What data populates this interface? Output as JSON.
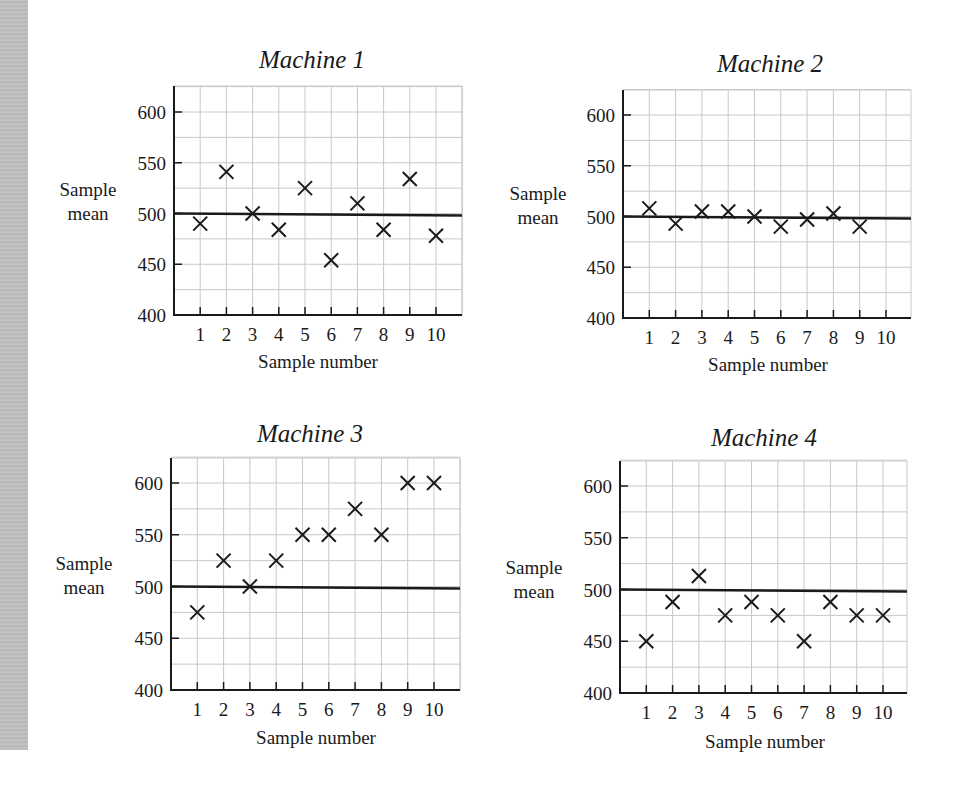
{
  "chart_data": [
    {
      "type": "scatter",
      "title": "Machine 1",
      "xlabel": "Sample number",
      "ylabel": "Sample mean",
      "x": [
        1,
        2,
        3,
        4,
        5,
        6,
        7,
        8,
        9,
        10
      ],
      "values": [
        490,
        541,
        500,
        484,
        525,
        454,
        510,
        484,
        534,
        478
      ],
      "reference_line": 500,
      "ylim": [
        400,
        620
      ],
      "yticks": [
        400,
        450,
        500,
        550,
        600
      ],
      "xticks": [
        1,
        2,
        3,
        4,
        5,
        6,
        7,
        8,
        9,
        10
      ],
      "grid": true,
      "marker": "x"
    },
    {
      "type": "scatter",
      "title": "Machine 2",
      "xlabel": "Sample number",
      "ylabel": "Sample mean",
      "x": [
        1,
        2,
        3,
        4,
        5,
        6,
        7,
        8,
        9
      ],
      "values": [
        508,
        493,
        505,
        505,
        500,
        490,
        497,
        503,
        490
      ],
      "reference_line": 500,
      "ylim": [
        400,
        620
      ],
      "yticks": [
        400,
        450,
        500,
        550,
        600
      ],
      "xticks": [
        1,
        2,
        3,
        4,
        5,
        6,
        7,
        8,
        9,
        10
      ],
      "grid": true,
      "marker": "x"
    },
    {
      "type": "scatter",
      "title": "Machine 3",
      "xlabel": "Sample number",
      "ylabel": "Sample mean",
      "x": [
        1,
        2,
        3,
        4,
        5,
        6,
        7,
        8,
        9,
        10
      ],
      "values": [
        475,
        525,
        500,
        525,
        550,
        550,
        575,
        550,
        600,
        600
      ],
      "reference_line": 500,
      "ylim": [
        400,
        620
      ],
      "yticks": [
        400,
        450,
        500,
        550,
        600
      ],
      "xticks": [
        1,
        2,
        3,
        4,
        5,
        6,
        7,
        8,
        9,
        10
      ],
      "grid": true,
      "marker": "x"
    },
    {
      "type": "scatter",
      "title": "Machine 4",
      "xlabel": "Sample number",
      "ylabel": "Sample mean",
      "x": [
        1,
        2,
        3,
        4,
        5,
        6,
        7,
        8,
        9,
        10
      ],
      "values": [
        450,
        488,
        513,
        475,
        488,
        475,
        450,
        488,
        475,
        475
      ],
      "reference_line": 500,
      "ylim": [
        400,
        620
      ],
      "yticks": [
        400,
        450,
        500,
        550,
        600
      ],
      "xticks": [
        1,
        2,
        3,
        4,
        5,
        6,
        7,
        8,
        9,
        10
      ],
      "grid": true,
      "marker": "x"
    }
  ],
  "panels": [
    {
      "title": "Machine 1",
      "ylabel_line1": "Sample",
      "ylabel_line2": "mean",
      "xlabel": "Sample number"
    },
    {
      "title": "Machine 2",
      "ylabel_line1": "Sample",
      "ylabel_line2": "mean",
      "xlabel": "Sample number"
    },
    {
      "title": "Machine 3",
      "ylabel_line1": "Sample",
      "ylabel_line2": "mean",
      "xlabel": "Sample number"
    },
    {
      "title": "Machine 4",
      "ylabel_line1": "Sample",
      "ylabel_line2": "mean",
      "xlabel": "Sample number"
    }
  ],
  "colors": {
    "axis": "#1a1a1a",
    "grid": "#c8c8c8",
    "marker": "#1a1a1a",
    "reference_line": "#1a1a1a",
    "side_strip": "#bdbdbd"
  }
}
